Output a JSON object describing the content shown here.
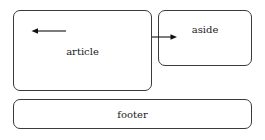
{
  "diagram": {
    "type": "html-layout-box-diagram",
    "background_color": "#ffffff",
    "line_color": "#3a3a3a",
    "arrow_color": "#111111",
    "text_color": "#1a1a1a",
    "boxes": [
      {
        "id": "article",
        "label": "article",
        "x": 13,
        "y": 10,
        "width": 139,
        "height": 81,
        "corner_radius": 7
      },
      {
        "id": "aside",
        "label": "aside",
        "x": 158,
        "y": 10,
        "width": 94,
        "height": 56,
        "corner_radius": 7
      },
      {
        "id": "footer",
        "label": "footer",
        "x": 13,
        "y": 99,
        "width": 239,
        "height": 30,
        "corner_radius": 7
      }
    ],
    "arrows": [
      {
        "id": "article-arrow",
        "direction": "left",
        "from_x": 66,
        "to_x": 32,
        "y": 31,
        "inside_box": "article"
      },
      {
        "id": "aside-arrow",
        "direction": "right",
        "from_x": 152,
        "to_x": 177,
        "y": 37,
        "from_box": "article",
        "to_box": "aside"
      }
    ]
  },
  "labels": {
    "article": "article",
    "aside": "aside",
    "footer": "footer"
  }
}
